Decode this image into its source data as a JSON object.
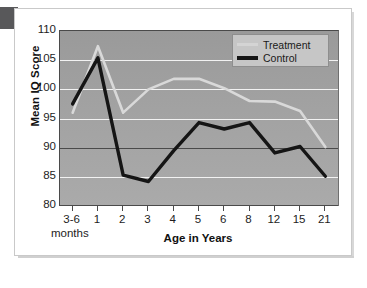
{
  "chart_data": {
    "type": "line",
    "title": "",
    "xlabel": "Age in Years",
    "xlabel_sub": "months",
    "ylabel": "Mean IQ Score",
    "categories": [
      "3-6",
      "1",
      "2",
      "3",
      "4",
      "5",
      "6",
      "8",
      "12",
      "15",
      "21"
    ],
    "ylim": [
      80,
      110
    ],
    "yticks": [
      80,
      85,
      90,
      95,
      100,
      105,
      110
    ],
    "ytick_labels": [
      "80",
      "85",
      "90",
      "95",
      "100",
      "105",
      "110"
    ],
    "grid": true,
    "gridlines_light": [
      85,
      95,
      100,
      105
    ],
    "gridline_dark": 90,
    "legend_position": "top-right",
    "series": [
      {
        "name": "Treatment",
        "color": "#d9d9d9",
        "values": [
          96.0,
          107.4,
          96.0,
          100.0,
          101.8,
          101.8,
          100.2,
          98.0,
          97.9,
          96.3,
          90.1
        ]
      },
      {
        "name": "Control",
        "color": "#151515",
        "values": [
          97.5,
          105.4,
          85.3,
          84.2,
          89.5,
          94.3,
          93.2,
          94.3,
          89.1,
          90.2,
          85.1
        ]
      }
    ]
  },
  "legend": {
    "items": [
      {
        "label": "Treatment"
      },
      {
        "label": "Control"
      }
    ]
  }
}
